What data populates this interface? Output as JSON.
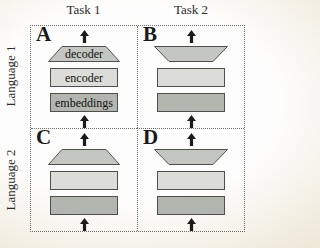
{
  "figure": {
    "column_headers": [
      "Task 1",
      "Task 2"
    ],
    "row_headers": [
      "Language 1",
      "Language 2"
    ],
    "panels": [
      {
        "letter": "A",
        "shape_labels": {
          "decoder": "decoder",
          "encoder": "encoder",
          "embeddings": "embeddings"
        }
      },
      {
        "letter": "B"
      },
      {
        "letter": "C"
      },
      {
        "letter": "D"
      }
    ],
    "colors": {
      "decoder_fill": "#c4c6c1",
      "encoder_fill": "#dcddd8",
      "embeddings_fill": "#b3b6af",
      "shape_outline": "#4f4f4f",
      "arrow": "#1b1b1b"
    }
  }
}
